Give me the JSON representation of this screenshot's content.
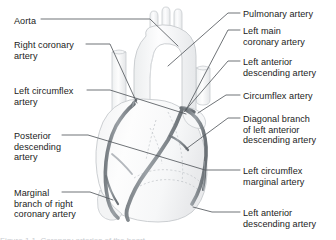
{
  "figure": {
    "background_color": "#ffffff",
    "text_color": "#1b1b1b",
    "leader_line_color": "#555a5f",
    "heart_fill_color": "#fbfbfc",
    "heart_outline_color": "#c6cacd",
    "artery_color": "#8d9297",
    "artery_outline_color": "#5e6469",
    "dashed_outline_color": "#c0c4c8"
  },
  "labels_left": [
    {
      "id": "aorta",
      "lines": [
        "Aorta"
      ],
      "x": 14,
      "y": 16
    },
    {
      "id": "right-coronary-artery",
      "lines": [
        "Right coronary",
        "artery"
      ],
      "x": 14,
      "y": 40
    },
    {
      "id": "left-circumflex-artery",
      "lines": [
        "Left circumflex",
        "artery"
      ],
      "x": 14,
      "y": 86
    },
    {
      "id": "posterior-descending-artery",
      "lines": [
        "Posterior",
        "descending",
        "artery"
      ],
      "x": 14,
      "y": 131
    },
    {
      "id": "marginal-branch-of-right-coronary-artery",
      "lines": [
        "Marginal",
        "branch of right",
        "coronary artery"
      ],
      "x": 14,
      "y": 188
    }
  ],
  "labels_right": [
    {
      "id": "pulmonary-artery",
      "lines": [
        "Pulmonary artery"
      ],
      "x": 243,
      "y": 9
    },
    {
      "id": "left-main-coronary-artery",
      "lines": [
        "Left main",
        "coronary artery"
      ],
      "x": 243,
      "y": 26
    },
    {
      "id": "left-anterior-descending-artery-top",
      "lines": [
        "Left anterior",
        "descending artery"
      ],
      "x": 243,
      "y": 57
    },
    {
      "id": "circumflex-artery",
      "lines": [
        "Circumflex artery"
      ],
      "x": 243,
      "y": 91
    },
    {
      "id": "diagonal-branch-of-left-anterior-descending-artery",
      "lines": [
        "Diagonal branch",
        "of left anterior",
        "descending artery"
      ],
      "x": 243,
      "y": 114
    },
    {
      "id": "left-circumflex-marginal-artery",
      "lines": [
        "Left circumflex",
        "marginal artery"
      ],
      "x": 243,
      "y": 166
    },
    {
      "id": "left-anterior-descending-artery-bottom",
      "lines": [
        "Left anterior",
        "descending artery"
      ],
      "x": 243,
      "y": 208
    }
  ],
  "bottom_cropped_caption": "Figure 1.1  Coronary arteries of the heart"
}
